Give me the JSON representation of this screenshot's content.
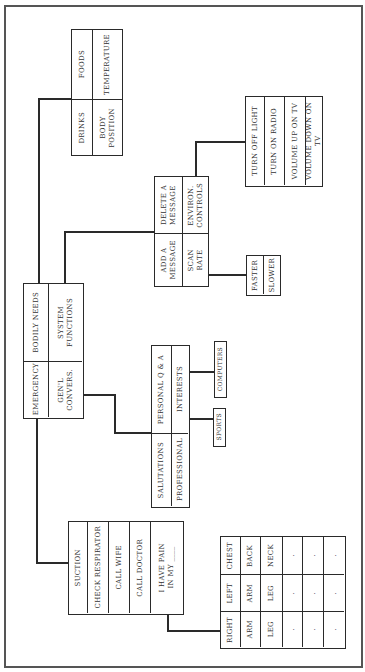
{
  "diagram": {
    "title": "",
    "orientation": "rotated 90° counter-clockwise",
    "colors": {
      "line": "#2a2a2a",
      "frame": "#555555",
      "background": "#ffffff"
    },
    "main_menu": {
      "emergency": "EMERGENCY",
      "bodily_needs": "BODILY NEEDS",
      "general_conversations": "GEN'L\nCONVERS.",
      "system_functions": "SYSTEM\nFUNCTIONS"
    },
    "bodily_needs_menu": {
      "drinks": "DRINKS",
      "foods": "FOODS",
      "body_position": "BODY\nPOSITION",
      "temperature": "TEMPERATURE"
    },
    "system_functions_menu": {
      "add_message": "ADD A\nMESSAGE",
      "delete_message": "DELETE A\nMESSAGE",
      "scan_rate": "SCAN\nRATE",
      "environ_controls": "ENVIRON.\nCONTROLS"
    },
    "environ_controls_menu": [
      "TURN OFF LIGHT",
      "TURN ON RADIO",
      "VOLUME UP ON TV",
      "VOLUME DOWN ON TV"
    ],
    "scan_rate_menu": [
      "FASTER",
      "SLOWER"
    ],
    "conversation_menu": {
      "salutations": "SALUTATIONS",
      "personal_qa": "PERSONAL Q & A",
      "professional": "PROFESSIONAL",
      "interests": "INTERESTS"
    },
    "interests_menu": {
      "computers": "COMPUTERS",
      "sports": "SPORTS"
    },
    "emergency_menu": [
      "SUCTION",
      "CHECK RESPIRATOR",
      "CALL WIFE",
      "CALL DOCTOR",
      "I HAVE PAIN\nIN MY ____"
    ],
    "pain_location_grid": {
      "rows": [
        [
          "RIGHT",
          "LEFT",
          "CHEST"
        ],
        [
          "ARM",
          "ARM",
          "BACK"
        ],
        [
          "LEG",
          "LEG",
          "NECK"
        ],
        [
          ".",
          ".",
          "."
        ],
        [
          ".",
          ".",
          "."
        ],
        [
          ".",
          ".",
          "."
        ]
      ]
    }
  }
}
